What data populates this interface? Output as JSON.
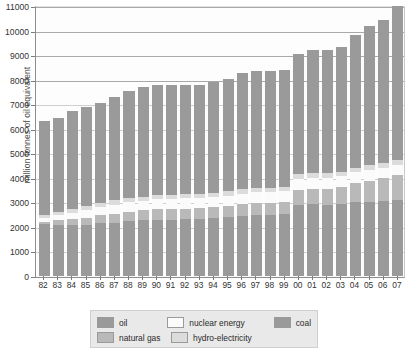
{
  "chart_data": {
    "type": "bar",
    "subtype": "stacked-bar",
    "title": "",
    "xlabel": "",
    "ylabel": "million tonnes of oil equivalent",
    "ylim": [
      0,
      11000
    ],
    "ytick_step": 1000,
    "yticks": [
      0,
      1000,
      2000,
      3000,
      4000,
      5000,
      6000,
      7000,
      8000,
      9000,
      10000,
      11000
    ],
    "ytick_labels": [
      "0",
      "1000",
      "2000",
      "3000",
      "4000",
      "5000",
      "6000",
      "7000",
      "8000",
      "9000",
      "10000",
      "11000"
    ],
    "grid": true,
    "grid_axis": "y",
    "legend_position": "bottom",
    "categories": [
      "82",
      "83",
      "84",
      "85",
      "86",
      "87",
      "88",
      "89",
      "90",
      "91",
      "92",
      "93",
      "94",
      "95",
      "96",
      "97",
      "98",
      "99",
      "00",
      "01",
      "02",
      "03",
      "04",
      "05",
      "06",
      "07"
    ],
    "totals": [
      6300,
      6420,
      6730,
      6900,
      7060,
      7290,
      7550,
      7720,
      7800,
      7780,
      7790,
      7800,
      7900,
      8030,
      8260,
      8360,
      8370,
      8400,
      9050,
      9200,
      9200,
      9330,
      9800,
      10200,
      10450,
      10990
    ],
    "series": [
      {
        "name": "oil",
        "color": "#9a9a9a",
        "values": [
          2100,
          2090,
          2080,
          2080,
          2140,
          2180,
          2240,
          2270,
          2300,
          2300,
          2320,
          2320,
          2360,
          2400,
          2450,
          2490,
          2500,
          2520,
          2900,
          2920,
          2900,
          2930,
          3000,
          3030,
          3050,
          3090
        ]
      },
      {
        "name": "natural gas",
        "color": "#b9b9b9",
        "values": [
          120,
          180,
          250,
          300,
          340,
          360,
          380,
          400,
          420,
          430,
          430,
          440,
          450,
          460,
          480,
          490,
          490,
          500,
          620,
          640,
          660,
          690,
          780,
          850,
          930,
          1010
        ]
      },
      {
        "name": "nuclear energy",
        "color": "#fbfbfb",
        "values": [
          140,
          200,
          250,
          300,
          340,
          370,
          390,
          400,
          410,
          410,
          410,
          410,
          420,
          420,
          430,
          430,
          430,
          440,
          440,
          440,
          440,
          440,
          440,
          440,
          440,
          440
        ]
      },
      {
        "name": "hydro-electricity",
        "color": "#dcdcdc",
        "values": [
          130,
          140,
          150,
          160,
          160,
          170,
          170,
          170,
          170,
          170,
          170,
          170,
          170,
          180,
          180,
          180,
          180,
          180,
          190,
          190,
          190,
          190,
          190,
          190,
          190,
          200
        ]
      },
      {
        "name": "coal",
        "color": "#9a9a9a",
        "values": [
          3810,
          3810,
          4000,
          4060,
          4080,
          4210,
          4370,
          4480,
          4500,
          4470,
          4460,
          4460,
          4500,
          4570,
          4720,
          4770,
          4770,
          4760,
          4900,
          5010,
          5010,
          5080,
          5390,
          5690,
          5840,
          6250
        ]
      }
    ]
  },
  "legend": {
    "items": [
      {
        "label": "oil",
        "swatch": "#9a9a9a"
      },
      {
        "label": "natural gas",
        "swatch": "#b9b9b9"
      },
      {
        "label": "nuclear energy",
        "swatch": "#fbfbfb"
      },
      {
        "label": "hydro-electricity",
        "swatch": "#dcdcdc"
      },
      {
        "label": "coal",
        "swatch": "#9a9a9a"
      }
    ]
  }
}
